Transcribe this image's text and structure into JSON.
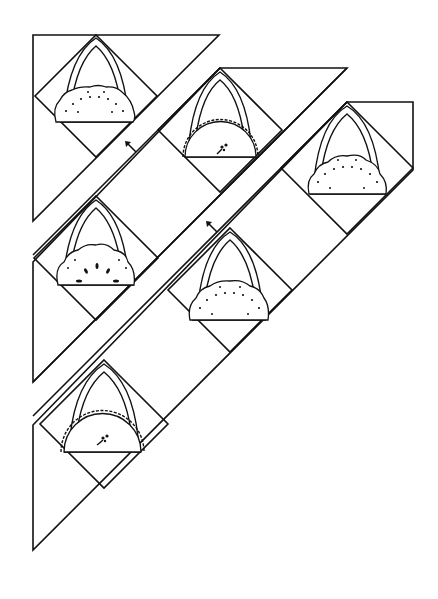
{
  "diagram": {
    "title": "Basket block quilt layout (diagonal set with sashing strips)",
    "stroke_color": "#111111",
    "background": "#ffffff",
    "rows": [
      {
        "label": "row-1",
        "blocks": [
          {
            "id": "block-1",
            "cx": 96,
            "top": 35,
            "fill": "dotted-scallop"
          }
        ]
      },
      {
        "label": "row-2",
        "blocks": [
          {
            "id": "block-2",
            "cx": 218,
            "top": 68,
            "fill": "bead-border-flower"
          },
          {
            "id": "block-3",
            "cx": 96,
            "top": 196,
            "fill": "leaf-scallop"
          }
        ]
      },
      {
        "label": "row-3",
        "blocks": [
          {
            "id": "block-4",
            "cx": 347,
            "top": 102,
            "fill": "dotted-scallop"
          },
          {
            "id": "block-5",
            "cx": 230,
            "top": 228,
            "fill": "dotted-scallop"
          },
          {
            "id": "block-6",
            "cx": 104,
            "top": 357,
            "fill": "bead-border-flower"
          }
        ]
      }
    ],
    "arrows": [
      {
        "name": "arrow-1",
        "x": 130,
        "y": 146,
        "direction": "up-left"
      },
      {
        "name": "arrow-2",
        "x": 211,
        "y": 226,
        "direction": "up-left"
      }
    ]
  }
}
